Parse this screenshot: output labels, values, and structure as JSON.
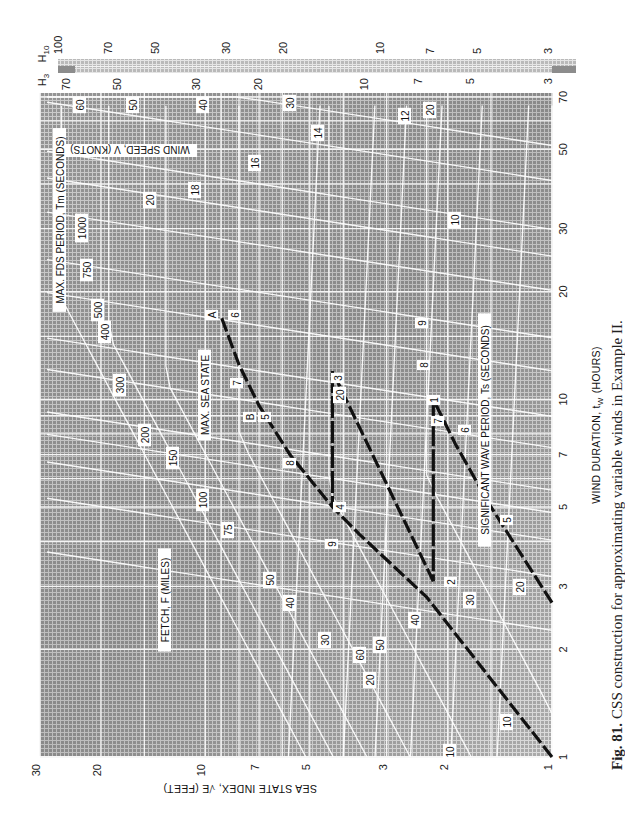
{
  "caption": {
    "fig_label": "Fig. 81.",
    "text": "CSS construction for approximating variable winds in Example II."
  },
  "axes": {
    "x_label": "WIND DURATION, t",
    "x_label_sub": "W",
    "x_label_unit": "(HOURS)",
    "y_label": "SEA STATE INDEX, √E (FEET)",
    "top_scale_h10_label": "H",
    "top_scale_h10_sub": "10",
    "top_scale_h3_label": "H",
    "top_scale_h3_sub": "3"
  },
  "curve_labels": {
    "wind_speed": "WIND SPEED, V (KNOTS)",
    "fetch": "FETCH, F (MILES)",
    "fds_period": "MAX. FDS PERIOD, T",
    "fds_period_sub": "m",
    "fds_period_unit": "(SECONDS)",
    "sig_wave_period": "SIGNIFICANT WAVE PERIOD, T",
    "sig_wave_period_sub": "s",
    "sig_wave_period_unit": "(SECONDS)",
    "max_sea_state": "MAX. SEA STATE"
  },
  "chart_data": {
    "type": "line",
    "title": "CSS construction for approximating variable winds in Example II.",
    "xlabel": "WIND DURATION, t_w (HOURS)",
    "ylabel": "SEA STATE INDEX, √E (FEET)",
    "orientation_note": "Figure printed rotated 90°; wind duration runs along page height, sea state index along page width",
    "x_scale": "log",
    "y_scale": "log",
    "xlim": [
      1,
      70
    ],
    "ylim": [
      1,
      30
    ],
    "x_ticks": [
      1,
      2,
      3,
      5,
      7,
      10,
      20,
      30,
      50,
      70
    ],
    "y_ticks": [
      1,
      2,
      3,
      5,
      7,
      10,
      20,
      30
    ],
    "top_scale_H3_ticks": [
      3,
      5,
      7,
      10,
      20,
      30,
      50,
      70
    ],
    "top_scale_H10_ticks": [
      3,
      5,
      7,
      10,
      20,
      30,
      50,
      70,
      100
    ],
    "wind_speed_knots_labels": [
      10,
      20,
      30,
      40,
      50,
      60
    ],
    "fetch_miles_labels": [
      10,
      20,
      30,
      40,
      50,
      75,
      100,
      150,
      200,
      300,
      400,
      500,
      750,
      1000
    ],
    "fds_period_seconds_labels": [
      12,
      14,
      16,
      18,
      20
    ],
    "sig_wave_period_seconds_labels": [
      5,
      6,
      7,
      8,
      9,
      10,
      12,
      20
    ],
    "grid": true,
    "series": [
      {
        "name": "Construction path (dashed)",
        "points": [
          {
            "label": "start",
            "duration_h": 1.0,
            "sea_state": 1.0
          },
          {
            "label": "along 40 kt",
            "duration_h": 2.8,
            "sea_state": 2.3
          },
          {
            "label": "9",
            "duration_h": 4.2,
            "sea_state": 3.6
          },
          {
            "label": "4",
            "duration_h": 5.0,
            "sea_state": 4.3
          },
          {
            "label": "8",
            "duration_h": 7.0,
            "sea_state": 5.7
          },
          {
            "label": "B / 5",
            "duration_h": 9.6,
            "sea_state": 7.0
          },
          {
            "label": "7",
            "duration_h": 12.5,
            "sea_state": 8.0
          },
          {
            "label": "A / 6",
            "duration_h": 17.0,
            "sea_state": 9.0
          }
        ]
      },
      {
        "name": "Segment 3-4 (vertical drop)",
        "points": [
          {
            "label": "3",
            "duration_h": 12.0,
            "sea_state": 4.3
          },
          {
            "label": "4",
            "duration_h": 5.0,
            "sea_state": 4.3
          }
        ]
      },
      {
        "name": "Segment 2-3 (dashed, 30 kt)",
        "points": [
          {
            "label": "2",
            "duration_h": 3.1,
            "sea_state": 2.2
          },
          {
            "label": "3",
            "duration_h": 12.0,
            "sea_state": 4.3
          }
        ]
      },
      {
        "name": "Segment 1-2 (vertical drop)",
        "points": [
          {
            "label": "1",
            "duration_h": 10.0,
            "sea_state": 2.2
          },
          {
            "label": "2",
            "duration_h": 3.1,
            "sea_state": 2.2
          }
        ]
      },
      {
        "name": "Segment 20 kt (dashed)",
        "points": [
          {
            "label": "start",
            "duration_h": 2.7,
            "sea_state": 1.0
          },
          {
            "label": "5",
            "duration_h": 5.0,
            "sea_state": 1.5
          },
          {
            "label": "6",
            "duration_h": 7.5,
            "sea_state": 1.9
          },
          {
            "label": "1",
            "duration_h": 10.0,
            "sea_state": 2.2
          }
        ]
      }
    ],
    "annotations": [
      "A",
      "B",
      "1",
      "2",
      "3",
      "4",
      "MAX. SEA STATE"
    ]
  }
}
